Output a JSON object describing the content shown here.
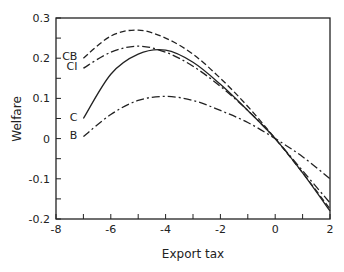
{
  "chart_data": {
    "type": "line",
    "title": "",
    "xlabel": "Export tax",
    "ylabel": "Welfare",
    "xlim": [
      -8,
      2
    ],
    "ylim": [
      -0.2,
      0.3
    ],
    "xticks": [
      -8,
      -6,
      -4,
      -2,
      0,
      2
    ],
    "xtick_labels": [
      "-8",
      "-6",
      "-4",
      "-2",
      "0",
      "2"
    ],
    "yticks": [
      -0.2,
      -0.1,
      0,
      0.1,
      0.2,
      0.3
    ],
    "ytick_labels": [
      "-0.2",
      "-0.1",
      "0",
      "0.1",
      "0.2",
      "0.3"
    ],
    "grid": false,
    "legend": "inline labels at left end of each curve",
    "x": [
      -7,
      -6,
      -5,
      -4,
      -3,
      -2,
      -1,
      0,
      1,
      2
    ],
    "series": [
      {
        "name": "CB",
        "style": "dashed",
        "values": [
          0.2,
          0.255,
          0.27,
          0.25,
          0.21,
          0.15,
          0.08,
          0.0,
          -0.085,
          -0.175
        ]
      },
      {
        "name": "CI",
        "style": "dash-dot",
        "values": [
          0.175,
          0.215,
          0.23,
          0.215,
          0.18,
          0.13,
          0.07,
          0.0,
          -0.08,
          -0.16
        ]
      },
      {
        "name": "C",
        "style": "solid",
        "values": [
          0.05,
          0.16,
          0.21,
          0.22,
          0.19,
          0.135,
          0.07,
          0.0,
          -0.085,
          -0.18
        ]
      },
      {
        "name": "B",
        "style": "dash-dot",
        "values": [
          0.005,
          0.06,
          0.095,
          0.105,
          0.095,
          0.07,
          0.04,
          0.0,
          -0.045,
          -0.1
        ]
      }
    ]
  }
}
